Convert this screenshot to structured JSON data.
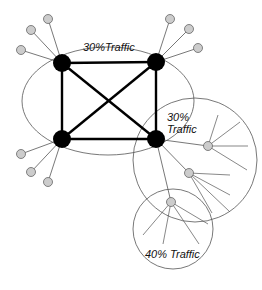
{
  "diagram": {
    "type": "network-topology",
    "colors": {
      "core_node": "#000000",
      "edge_node": "#cccccc",
      "edge_node_stroke": "#666666",
      "boundary": "#555555",
      "link": "#555555",
      "core_link": "#000000"
    },
    "labels": {
      "core_region": "30%Traffic",
      "mid_region_line1": "30%",
      "mid_region_line2": "Traffic",
      "outer_region": "40% Traffic"
    },
    "regions": [
      {
        "id": "core",
        "label": "30%Traffic",
        "traffic_pct": 30
      },
      {
        "id": "mid",
        "label": "30% Traffic",
        "traffic_pct": 30
      },
      {
        "id": "outer",
        "label": "40% Traffic",
        "traffic_pct": 40
      }
    ],
    "core_nodes": [
      "top-left",
      "top-right",
      "bottom-left",
      "bottom-right"
    ],
    "edge_node_count": 12
  }
}
